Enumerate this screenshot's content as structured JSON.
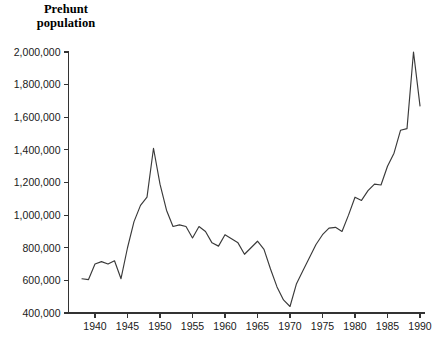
{
  "chart_data": {
    "type": "line",
    "title": "Prehunt population",
    "title_line1": "Prehunt",
    "title_line2": "population",
    "xlabel": "",
    "ylabel": "",
    "xlim": [
      1937,
      1991
    ],
    "ylim": [
      400000,
      2000000
    ],
    "grid": false,
    "legend": null,
    "line_color": "#3a3a3a",
    "axis_color": "#333333",
    "background_color": "#ffffff",
    "ytick_labels": [
      "400,000",
      "600,000",
      "800,000",
      "1,000,000",
      "1,200,000",
      "1,400,000",
      "1,600,000",
      "1,800,000",
      "2,000,000"
    ],
    "ytick_values": [
      400000,
      600000,
      800000,
      1000000,
      1200000,
      1400000,
      1600000,
      1800000,
      2000000
    ],
    "xtick_labels": [
      "1940",
      "1945",
      "1950",
      "1955",
      "1960",
      "1965",
      "1970",
      "1975",
      "1980",
      "1985",
      "1990"
    ],
    "xtick_values": [
      1940,
      1945,
      1950,
      1955,
      1960,
      1965,
      1970,
      1975,
      1980,
      1985,
      1990
    ],
    "x": [
      1938,
      1939,
      1940,
      1941,
      1942,
      1943,
      1944,
      1945,
      1946,
      1947,
      1948,
      1949,
      1950,
      1951,
      1952,
      1953,
      1954,
      1955,
      1956,
      1957,
      1958,
      1959,
      1960,
      1961,
      1962,
      1963,
      1964,
      1965,
      1966,
      1967,
      1968,
      1969,
      1970,
      1971,
      1972,
      1973,
      1974,
      1975,
      1976,
      1977,
      1978,
      1979,
      1980,
      1981,
      1982,
      1983,
      1984,
      1985,
      1986,
      1987,
      1988,
      1989,
      1990
    ],
    "values": [
      610000,
      605000,
      700000,
      715000,
      700000,
      720000,
      610000,
      800000,
      960000,
      1060000,
      1110000,
      1410000,
      1190000,
      1030000,
      930000,
      940000,
      930000,
      860000,
      930000,
      900000,
      830000,
      810000,
      880000,
      855000,
      830000,
      760000,
      800000,
      840000,
      790000,
      670000,
      560000,
      480000,
      440000,
      580000,
      660000,
      740000,
      820000,
      880000,
      920000,
      925000,
      900000,
      1000000,
      1110000,
      1090000,
      1150000,
      1190000,
      1185000,
      1300000,
      1380000,
      1520000,
      1530000,
      2000000,
      1670000
    ]
  }
}
